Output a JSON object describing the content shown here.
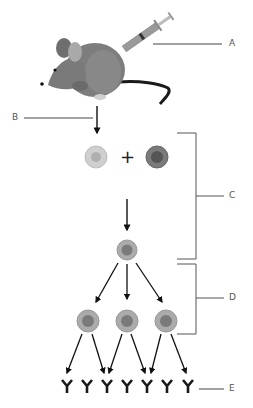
{
  "diagram": {
    "labels": {
      "A": "A",
      "B": "B",
      "C": "C",
      "D": "D",
      "E": "E"
    },
    "operator": "+",
    "colors": {
      "mouse_body": "#7d7d7d",
      "mouse_dark": "#5f5f5f",
      "tail": "#1a1a1a",
      "b_cell_outer": "#c9c9c9",
      "b_cell_inner": "#b0b0b0",
      "myeloma_outer": "#7a7a7a",
      "myeloma_inner": "#555555",
      "hybridoma_outer": "#a8a8a8",
      "hybridoma_inner": "#7a7a7a",
      "antibody": "#1a1a1a",
      "line": "#444444"
    },
    "antibody_count": 7
  }
}
